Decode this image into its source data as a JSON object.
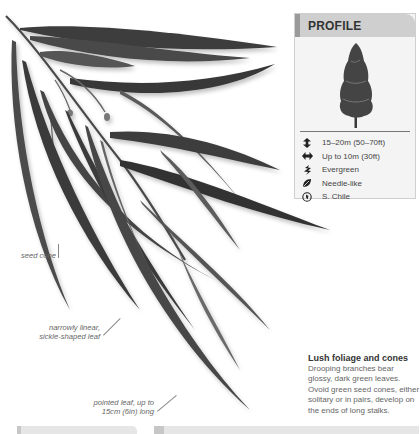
{
  "profile": {
    "title": "PROFILE",
    "facts": [
      {
        "icon": "height-arrows-icon",
        "text": "15–20m (50–70ft)"
      },
      {
        "icon": "width-arrows-icon",
        "text": "Up to 10m (30ft)"
      },
      {
        "icon": "evergreen-leaf-icon",
        "text": "Evergreen"
      },
      {
        "icon": "leaf-shape-icon",
        "text": "Needle-like"
      },
      {
        "icon": "globe-icon",
        "text": "S. Chile"
      }
    ]
  },
  "annotations": {
    "seed_cone": "seed cone",
    "leaf_shape_line1": "narrowly linear,",
    "leaf_shape_line2": "sickle-shaped leaf",
    "leaf_size_line1": "pointed leaf, up to",
    "leaf_size_line2": "15cm (6in) long"
  },
  "caption": {
    "title": "Lush foliage and cones",
    "body": "Drooping branches bear glossy, dark green leaves. Ovoid green seed cones, either solitary or in pairs, develop on the ends of long stalks."
  },
  "colors": {
    "leaf_dark": "#3a3a3a",
    "leaf_mid": "#5e5e5e",
    "panel_bg": "#f4f4f4",
    "panel_header": "#cfcfcf"
  }
}
